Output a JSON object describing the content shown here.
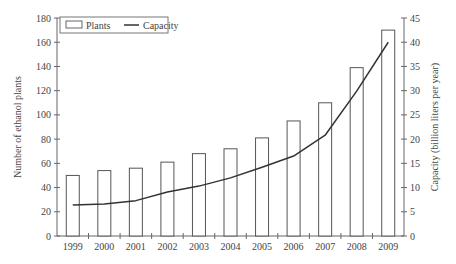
{
  "chart_data": {
    "type": "bar+line",
    "title": "",
    "xlabel": "",
    "ylabel": "Number of ethanol plants",
    "y2label": "Capacity (billion liters per year)",
    "categories": [
      "1999",
      "2000",
      "2001",
      "2002",
      "2003",
      "2004",
      "2005",
      "2006",
      "2007",
      "2008",
      "2009"
    ],
    "series": [
      {
        "name": "Plants",
        "type": "bar",
        "axis": "left",
        "values": [
          50,
          54,
          56,
          61,
          68,
          72,
          81,
          95,
          110,
          139,
          170
        ]
      },
      {
        "name": "Capacity",
        "type": "line",
        "axis": "right",
        "values": [
          6.4,
          6.6,
          7.3,
          9.1,
          10.3,
          12.0,
          14.2,
          16.5,
          20.8,
          29.9,
          40.0
        ]
      }
    ],
    "ylim": [
      0,
      180
    ],
    "y_ticks": [
      0,
      20,
      40,
      60,
      80,
      100,
      120,
      140,
      160,
      180
    ],
    "y2lim": [
      0,
      45
    ],
    "y2_ticks": [
      0,
      5,
      10,
      15,
      20,
      25,
      30,
      35,
      40,
      45
    ],
    "grid": false,
    "legend": {
      "position": "top-left",
      "entries": [
        "Plants",
        "Capacity"
      ]
    }
  },
  "colors": {
    "bar_stroke": "#555555",
    "bar_fill": "#ffffff",
    "line": "#333333",
    "axis": "#666666"
  }
}
